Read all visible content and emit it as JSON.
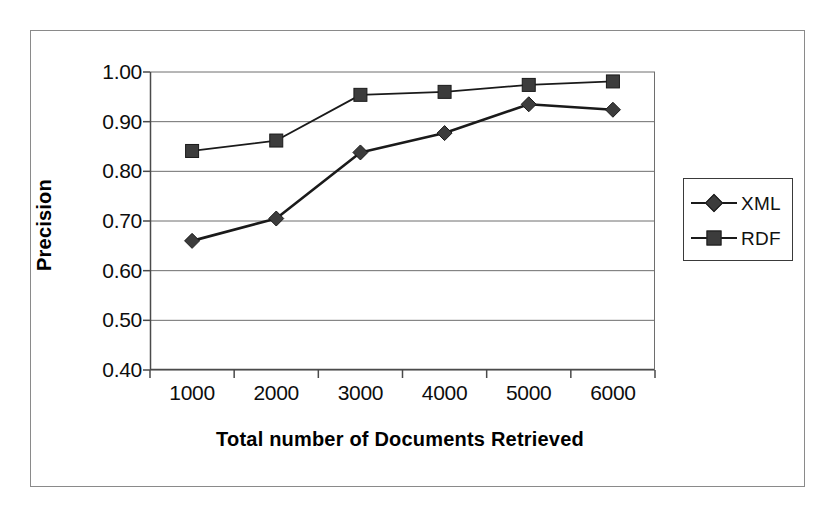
{
  "chart_data": {
    "type": "line",
    "title": "",
    "xlabel": "Total number of Documents Retrieved",
    "ylabel": "Precision",
    "categories": [
      "1000",
      "2000",
      "3000",
      "4000",
      "5000",
      "6000"
    ],
    "x": [
      1000,
      2000,
      3000,
      4000,
      5000,
      6000
    ],
    "ylim": [
      0.4,
      1.0
    ],
    "yticks": [
      "0.40",
      "0.50",
      "0.60",
      "0.70",
      "0.80",
      "0.90",
      "1.00"
    ],
    "ytick_values": [
      0.4,
      0.5,
      0.6,
      0.7,
      0.8,
      0.9,
      1.0
    ],
    "grid": "horizontal",
    "legend_position": "right",
    "series": [
      {
        "name": "XML",
        "marker": "diamond",
        "color": "#3c3c3c",
        "values": [
          0.66,
          0.705,
          0.838,
          0.877,
          0.935,
          0.924
        ]
      },
      {
        "name": "RDF",
        "marker": "square",
        "color": "#3c3c3c",
        "values": [
          0.841,
          0.862,
          0.954,
          0.96,
          0.974,
          0.981
        ]
      }
    ]
  },
  "legend": {
    "items": [
      {
        "label": "XML",
        "marker": "diamond"
      },
      {
        "label": "RDF",
        "marker": "square"
      }
    ]
  },
  "colors": {
    "line": "#1a1a1a",
    "marker_fill": "#3c3c3c",
    "grid": "#6e6e6e",
    "axis": "#4a4a4a",
    "frame": "#8a8a8a",
    "text": "#000000"
  }
}
